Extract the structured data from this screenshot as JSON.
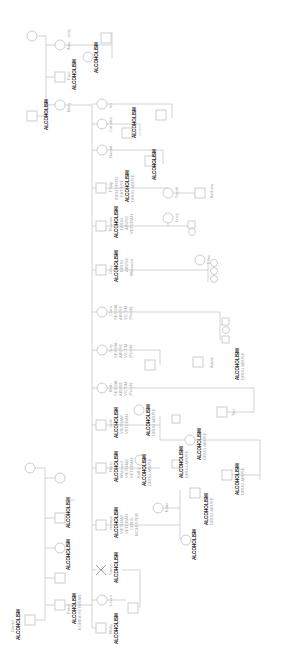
{
  "people": {
    "jerry": {
      "name": "Jerry"
    },
    "amy": {
      "name": "Amy"
    },
    "amy_spouse": {
      "notes": [
        "ALCOHOLISM"
      ]
    },
    "paul": {
      "name": "Paul",
      "notes": [
        "ALCOHOLISM"
      ]
    },
    "mary": {
      "name": "Mary"
    },
    "mary_spouse": {
      "notes": [
        "ALCOHOLISM"
      ]
    },
    "ira": {
      "name": "Ira"
    },
    "candice": {
      "name": "Candice"
    },
    "candice_spouse": {
      "notes": [
        "ALCOHOLISM"
      ]
    },
    "naomi": {
      "name": "Naomi"
    },
    "naomi_spouse": {
      "notes": [
        "ALCOHOLISM"
      ]
    },
    "philip": {
      "name": "Philip",
      "notes": [
        "IDENTIFIED",
        "PATIENT",
        "ALCOHOLISM/",
        "DRUG ABUSE"
      ]
    },
    "sarah": {
      "name": "Sarah"
    },
    "andrew": {
      "name": "Andrew"
    },
    "thomas": {
      "name": "Thomas",
      "notes": [
        "ALCOHOLISM/",
        "DRUG",
        "ABUSE",
        "VETERAN"
      ]
    },
    "lucy": {
      "name": "Lucy"
    },
    "gary": {
      "name": "Gary",
      "notes": [
        "ALCOHOLISM/",
        "DRUG",
        "ABUSE",
        "Widowed"
      ]
    },
    "ellen": {
      "name": "Ellen"
    },
    "clara": {
      "name": "Clara",
      "notes": [
        "SEXUAL",
        "ABUSE",
        "VICTIM",
        "(Frank)"
      ]
    },
    "judy": {
      "name": "Judy",
      "notes": [
        "SEXUAL",
        "ABUSE",
        "VICTIM",
        "(Frank)"
      ]
    },
    "beth": {
      "name": "Beth",
      "notes": [
        "SEXUAL",
        "ABUSE",
        "VICTIM",
        "(Frank)"
      ]
    },
    "aaron": {
      "name": "Aaron"
    },
    "aaron_rel": {
      "notes": [
        "ALCOHOLISM/",
        "DRUG ABUSE"
      ]
    },
    "tim": {
      "name": "Tim"
    },
    "jack": {
      "name": "Jack",
      "notes": [
        "ALCOHOLISM",
        "VIETNAM",
        "VETERAN"
      ]
    },
    "jack_spouse": {
      "notes": [
        "ALCOHOLISM/",
        "DRUG ABUSE"
      ]
    },
    "jack_child": {
      "notes": [
        "ALCOHOLISM/",
        "DRUG ABUSE"
      ]
    },
    "jack_grandchild": {
      "notes": [
        "ALCOHOLISM/",
        "DRUG ABUSE"
      ]
    },
    "harry": {
      "name": "Harry",
      "notes": [
        "ALCOHOLISM",
        "Widowed",
        "VIETNAM",
        "VETERAN"
      ]
    },
    "kathy": {
      "name": "Kathy",
      "notes": [
        "ALCOHOLISM/",
        "DRUG ABUSE"
      ]
    },
    "kathy_spouse": {
      "notes": [
        "ALCOHOLISM/",
        "DRUG ABUSE"
      ]
    },
    "katie": {
      "name": "Katie"
    },
    "katie_spouse": {
      "notes": [
        "ALCOHOLISM/",
        "DRUG ABUSE"
      ]
    },
    "katie_child": {
      "notes": [
        "ALCOHOLISM"
      ]
    },
    "george": {
      "name": "George",
      "notes": [
        "ALCOHOLISM",
        "VIETNAM",
        "VETERAN",
        "CHILD",
        "MOLESTER"
      ]
    },
    "sonja": {
      "name": "Sonja",
      "notes": [
        "ALCOHOLISM"
      ]
    },
    "laura": {
      "name": "Laura"
    },
    "wally": {
      "name": "Wally",
      "notes": [
        "ALCOHOLISM"
      ]
    },
    "daniel": {
      "name": "Daniel",
      "notes": [
        "ALCOHOLISM"
      ]
    },
    "peter": {
      "name": "Peter",
      "notes": [
        "ALCOHOLISM",
        "KOREA VETERAN"
      ]
    },
    "peter_sib1": {
      "notes": [
        "ALCOHOLISM"
      ]
    },
    "peter_sib2": {
      "notes": [
        "ALCOHOLISM"
      ]
    }
  }
}
